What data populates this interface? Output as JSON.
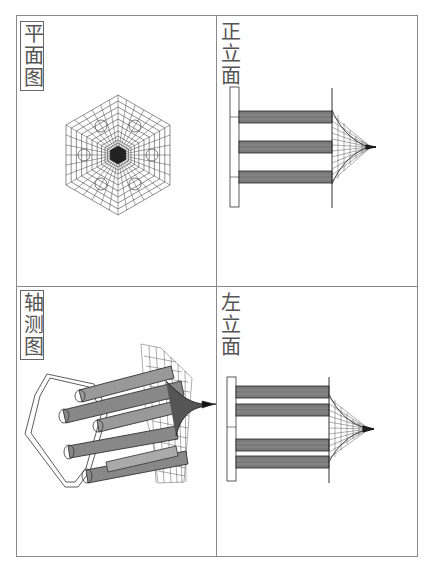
{
  "figure": {
    "panels": [
      {
        "id": "plan",
        "label": "平面图",
        "position": "top-left"
      },
      {
        "id": "front",
        "label": "正立面",
        "position": "top-right"
      },
      {
        "id": "axonometric",
        "label": "轴测图",
        "position": "bottom-left"
      },
      {
        "id": "left",
        "label": "左立面",
        "position": "bottom-right"
      }
    ]
  },
  "colors": {
    "frame": "#8a8a8a",
    "mesh": "#333333",
    "dense": "#1a1a1a",
    "label": "#555555"
  }
}
